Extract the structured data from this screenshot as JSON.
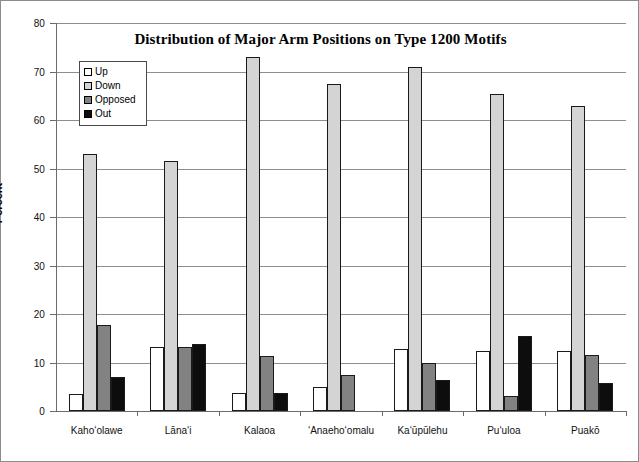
{
  "chart_data": {
    "type": "bar",
    "title": "Distribution of Major Arm Positions on Type 1200 Motifs",
    "xlabel": "",
    "ylabel": "Percent",
    "ylim": [
      0,
      80
    ],
    "ytick_step": 10,
    "yticks": [
      "0",
      "10",
      "20",
      "30",
      "40",
      "50",
      "60",
      "70",
      "80"
    ],
    "grid": "horizontal",
    "legend_position": "inside-upper-left",
    "categories": [
      "Kahoʻolawe",
      "Lānaʻi",
      "Kalaoa",
      "ʻAnaehoʻomalu",
      "Kaʻūpūlehu",
      "Puʻuloa",
      "Puakō"
    ],
    "series": [
      {
        "name": "Up",
        "color": "#ffffff",
        "values": [
          3.6,
          13.3,
          3.8,
          5.0,
          12.8,
          12.3,
          12.3
        ]
      },
      {
        "name": "Down",
        "color": "#d4d4d4",
        "values": [
          52.9,
          51.6,
          73.0,
          67.4,
          70.9,
          65.4,
          62.9
        ]
      },
      {
        "name": "Opposed",
        "color": "#828282",
        "values": [
          17.8,
          13.2,
          11.4,
          7.5,
          9.8,
          3.1,
          11.6
        ]
      },
      {
        "name": "Out",
        "color": "#0d0d0d",
        "values": [
          7.1,
          13.9,
          3.8,
          0.0,
          6.4,
          15.4,
          5.7
        ]
      }
    ]
  },
  "legend": {
    "items": [
      {
        "label": "Up",
        "color": "#ffffff"
      },
      {
        "label": "Down",
        "color": "#d4d4d4"
      },
      {
        "label": "Opposed",
        "color": "#828282"
      },
      {
        "label": "Out",
        "color": "#0d0d0d"
      }
    ]
  }
}
